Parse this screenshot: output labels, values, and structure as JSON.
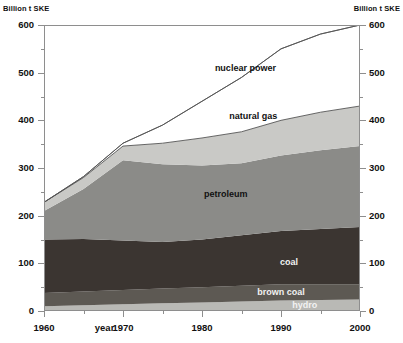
{
  "chart": {
    "axis_title_left": "Billion t SKE",
    "axis_title_right": "Billion t SKE",
    "xaxis_name": "year"
  },
  "chart_data": {
    "type": "area",
    "stacked": true,
    "title": "",
    "xlabel": "year",
    "ylabel": "Billion t SKE",
    "ylabel_right": "Billion t SKE",
    "xlim": [
      1960,
      2000
    ],
    "ylim": [
      0,
      600
    ],
    "ytick_labels": [
      "0",
      "100",
      "200",
      "300",
      "400",
      "500",
      "600"
    ],
    "ytick_values": [
      0,
      100,
      200,
      300,
      400,
      500,
      600
    ],
    "yminor_step": 50,
    "xtick_labels": [
      "1960",
      "1970",
      "1980",
      "1990",
      "2000"
    ],
    "xtick_values": [
      1960,
      1970,
      1980,
      1990,
      2000
    ],
    "grid": false,
    "legend": "inline-labels",
    "x": [
      1960,
      1965,
      1970,
      1975,
      1980,
      1985,
      1990,
      1995,
      2000
    ],
    "series": [
      {
        "name": "hydro",
        "label": "hydro",
        "color": "#b9b9b5",
        "values": [
          10,
          12,
          14,
          16,
          18,
          20,
          22,
          23,
          24
        ]
      },
      {
        "name": "brown coal",
        "label": "brown coal",
        "color": "#5d5953",
        "values": [
          28,
          29,
          30,
          31,
          32,
          33,
          34,
          33,
          32
        ]
      },
      {
        "name": "coal",
        "label": "coal",
        "color": "#3b3531",
        "values": [
          112,
          110,
          104,
          98,
          100,
          106,
          112,
          116,
          120
        ]
      },
      {
        "name": "petroleum",
        "label": "petroleum",
        "color": "#8b8b88",
        "values": [
          60,
          105,
          168,
          163,
          155,
          151,
          158,
          165,
          170
        ]
      },
      {
        "name": "natural gas",
        "label": "natural gas",
        "color": "#c9c9c6",
        "values": [
          18,
          24,
          30,
          44,
          58,
          66,
          74,
          80,
          84
        ]
      },
      {
        "name": "nuclear power",
        "label": "nuclear power",
        "color": "#ffffff",
        "values": [
          0,
          2,
          6,
          38,
          77,
          114,
          150,
          164,
          170
        ]
      }
    ],
    "totals": [
      228,
      282,
      352,
      390,
      440,
      490,
      550,
      581,
      600
    ]
  }
}
